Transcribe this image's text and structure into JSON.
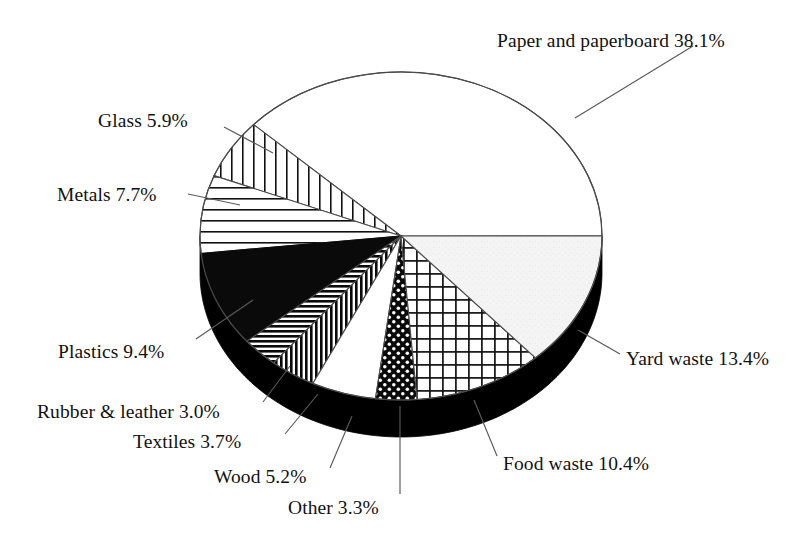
{
  "chart_data": {
    "type": "pie",
    "title": "",
    "subtitle": "",
    "xlabel": "",
    "ylabel": "",
    "legend_position": "none",
    "grid": false,
    "style": "3d-pie-black-rim",
    "units": "percent",
    "total": 100.1,
    "categories": [
      "Paper and paperboard",
      "Yard waste",
      "Food waste",
      "Other",
      "Wood",
      "Textiles",
      "Rubber & leather",
      "Plastics",
      "Metals",
      "Glass"
    ],
    "values": [
      38.1,
      13.4,
      10.4,
      3.3,
      5.2,
      3.7,
      3.0,
      9.4,
      7.7,
      5.9
    ],
    "slices": [
      {
        "name": "Paper and paperboard",
        "value": 38.1,
        "label": "Paper and paperboard 38.1%",
        "fill": "white",
        "pattern": "none",
        "color": "#ffffff",
        "start_angle": 0.0,
        "sweep_angle": 137.2
      },
      {
        "name": "Glass",
        "value": 5.9,
        "label": "Glass 5.9%",
        "fill": "pattern",
        "pattern": "vertical-lines",
        "color": "#ffffff",
        "start_angle": 137.2,
        "sweep_angle": 21.2
      },
      {
        "name": "Metals",
        "value": 7.7,
        "label": "Metals 7.7%",
        "fill": "pattern",
        "pattern": "horizontal-lines",
        "color": "#ffffff",
        "start_angle": 158.4,
        "sweep_angle": 27.7
      },
      {
        "name": "Plastics",
        "value": 9.4,
        "label": "Plastics 9.4%",
        "fill": "solid",
        "pattern": "solid-black",
        "color": "#000000",
        "start_angle": 186.1,
        "sweep_angle": 33.8
      },
      {
        "name": "Rubber & leather",
        "value": 3.0,
        "label": "Rubber & leather 3.0%",
        "fill": "pattern",
        "pattern": "dense-horizontal-stripes",
        "color": "#000000",
        "start_angle": 219.9,
        "sweep_angle": 10.8
      },
      {
        "name": "Textiles",
        "value": 3.7,
        "label": "Textiles 3.7%",
        "fill": "pattern",
        "pattern": "dense-vertical-stripes",
        "color": "#000000",
        "start_angle": 230.7,
        "sweep_angle": 13.3
      },
      {
        "name": "Wood",
        "value": 5.2,
        "label": "Wood 5.2%",
        "fill": "white",
        "pattern": "none",
        "color": "#ffffff",
        "start_angle": 244.0,
        "sweep_angle": 18.7
      },
      {
        "name": "Other",
        "value": 3.3,
        "label": "Other 3.3%",
        "fill": "pattern",
        "pattern": "black-with-white-dots",
        "color": "#000000",
        "start_angle": 262.7,
        "sweep_angle": 11.9
      },
      {
        "name": "Food waste",
        "value": 10.4,
        "label": "Food waste 10.4%",
        "fill": "pattern",
        "pattern": "cross-hatch-grid",
        "color": "#ffffff",
        "start_angle": 274.6,
        "sweep_angle": 37.4
      },
      {
        "name": "Yard waste",
        "value": 13.4,
        "label": "Yard waste 13.4%",
        "fill": "light",
        "pattern": "light-speckle",
        "color": "#f2f2f2",
        "start_angle": 312.0,
        "sweep_angle": 48.1
      }
    ]
  },
  "labels": {
    "paper": "Paper and paperboard 38.1%",
    "glass": "Glass 5.9%",
    "metals": "Metals 7.7%",
    "plastics": "Plastics 9.4%",
    "rubber": "Rubber & leather 3.0%",
    "textiles": "Textiles 3.7%",
    "wood": "Wood 5.2%",
    "other": "Other 3.3%",
    "yard": "Yard waste 13.4%",
    "food": "Food waste 10.4%"
  },
  "geometry": {
    "center_x": 401,
    "center_y": 236,
    "radius_x": 201,
    "radius_y": 164,
    "depth": 37,
    "rim_color": "#000000",
    "outline_color": "#4a4a4a"
  }
}
